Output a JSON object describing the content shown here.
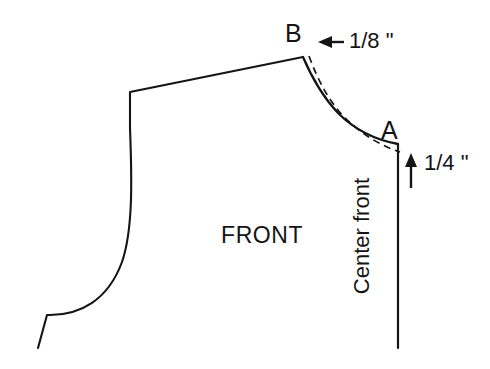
{
  "figure": {
    "type": "technical-pattern-drawing",
    "background_color": "#ffffff",
    "line_color": "#151515"
  },
  "labels": {
    "point_b": "B",
    "point_a": "A",
    "piece_name": "FRONT",
    "center_front": "Center front"
  },
  "dimensions": [
    {
      "id": "neck-shoulder-offset",
      "value": "1/8 \"",
      "arrow_direction": "left",
      "near_point": "B"
    },
    {
      "id": "center-front-drop",
      "value": "1/4 \"",
      "arrow_direction": "up",
      "near_point": "A"
    }
  ],
  "geometry": {
    "pattern_outline": "M 38 348 L 47 315 C 80 316 108 300 122 262 C 133 230 132 180 130 128 L 130 92 L 303 57",
    "neckline_solid": "M 303 57 C 312 78 322 96 338 113 C 356 131 376 140 398 144",
    "neckline_dashed": "M 309 56 C 318 80 327 98 343 116 C 361 134 381 146 400 152",
    "center_front_vertical": "M 398 144 L 398 348"
  },
  "annotations": {
    "arrow_eighth": {
      "line": "M 344 42 L 322 42",
      "head": "318 42 332 36 332 48"
    },
    "arrow_quarter": {
      "line": "M 411 188 L 411 161",
      "head": "411 153 405 167 417 167"
    }
  }
}
